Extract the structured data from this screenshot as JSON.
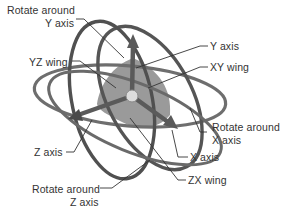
{
  "diagram": {
    "labels": {
      "rotate_y_line1": "Rotate around",
      "rotate_y_line2": "Y axis",
      "yz_wing": "YZ wing",
      "y_axis": "Y axis",
      "xy_wing": "XY wing",
      "rotate_x_line1": "Rotate around",
      "rotate_x_line2": "X axis",
      "z_axis": "Z axis",
      "x_axis": "X axis",
      "zx_wing": "ZX wing",
      "rotate_z_line1": "Rotate around",
      "rotate_z_line2": "Z axis"
    },
    "colors": {
      "ring_dark": "#555555",
      "ring_mid": "#6e6e6e",
      "wing_fill": "#9a9a9a",
      "axis": "#5a5a5a",
      "center": "#dcdcdc",
      "leader": "#333333",
      "text": "#333333"
    }
  }
}
